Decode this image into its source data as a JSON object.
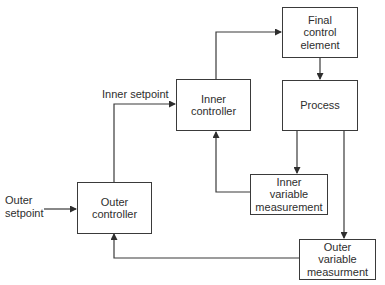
{
  "diagram": {
    "type": "cascade control block diagram",
    "blocks": {
      "final_control_element": {
        "label": "Final\ncontrol\nelement"
      },
      "process": {
        "label": "Process"
      },
      "inner_controller": {
        "label": "Inner\ncontroller"
      },
      "outer_controller": {
        "label": "Outer\ncontroller"
      },
      "inner_variable_measurement": {
        "label": "Inner\nvariable\nmeasurement"
      },
      "outer_variable_measurement": {
        "label": "Outer\nvariable\nmeasurment"
      }
    },
    "signals": {
      "inner_setpoint": {
        "label": "Inner setpoint"
      },
      "outer_setpoint": {
        "label": "Outer\nsetpoint"
      }
    },
    "connections": [
      {
        "from": "outer_setpoint",
        "to": "outer_controller"
      },
      {
        "from": "outer_controller",
        "to": "inner_controller",
        "label": "Inner setpoint"
      },
      {
        "from": "inner_controller",
        "to": "final_control_element"
      },
      {
        "from": "final_control_element",
        "to": "process"
      },
      {
        "from": "process",
        "to": "inner_variable_measurement"
      },
      {
        "from": "process",
        "to": "outer_variable_measurement"
      },
      {
        "from": "inner_variable_measurement",
        "to": "inner_controller"
      },
      {
        "from": "outer_variable_measurement",
        "to": "outer_controller"
      }
    ],
    "colors": {
      "line": "#3a3a3a",
      "text": "#2e2e2e",
      "background": "#ffffff"
    }
  }
}
